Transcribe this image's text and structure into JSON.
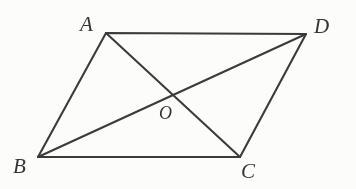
{
  "figure": {
    "kind": "geometry-diagram",
    "shape_name": "parallelogram",
    "width": 356,
    "height": 189,
    "background_color": "#fcfcfb",
    "stroke_color": "#3b3b3b",
    "label_color": "#353535"
  },
  "labels": {
    "a": "A",
    "b": "B",
    "c": "C",
    "d": "D",
    "o": "O"
  },
  "geometry": {
    "points": {
      "A": {
        "x": 106,
        "y": 33
      },
      "B": {
        "x": 38,
        "y": 157
      },
      "C": {
        "x": 240,
        "y": 157
      },
      "D": {
        "x": 306,
        "y": 34
      },
      "O": {
        "x": 172,
        "y": 96
      }
    },
    "label_positions": {
      "A": {
        "x": 80,
        "y": 14
      },
      "B": {
        "x": 13,
        "y": 156
      },
      "C": {
        "x": 241,
        "y": 161
      },
      "D": {
        "x": 314,
        "y": 16
      },
      "O": {
        "x": 159,
        "y": 104
      }
    },
    "edges": [
      {
        "name": "AB",
        "from": "A",
        "to": "B"
      },
      {
        "name": "BC",
        "from": "B",
        "to": "C"
      },
      {
        "name": "CD",
        "from": "C",
        "to": "D"
      },
      {
        "name": "DA",
        "from": "D",
        "to": "A"
      }
    ],
    "diagonals": [
      {
        "name": "AC",
        "from": "A",
        "to": "C"
      },
      {
        "name": "BD",
        "from": "B",
        "to": "D"
      }
    ]
  },
  "chart_data": {
    "type": "diagram",
    "title": "",
    "vertices": [
      "A",
      "B",
      "C",
      "D"
    ],
    "interior_point": "O",
    "coordinates": {
      "A": [
        106,
        33
      ],
      "B": [
        38,
        157
      ],
      "C": [
        240,
        157
      ],
      "D": [
        306,
        34
      ],
      "O": [
        172,
        96
      ]
    },
    "segments": [
      "AB",
      "BC",
      "CD",
      "DA",
      "AC",
      "BD"
    ],
    "annotations": [
      "O is the intersection of diagonals AC and BD"
    ]
  }
}
